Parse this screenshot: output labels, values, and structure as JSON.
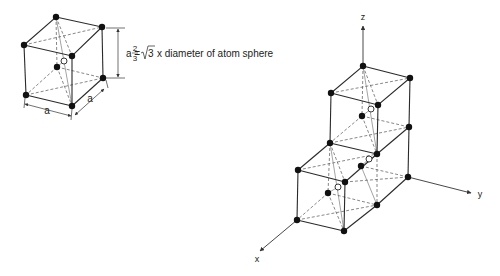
{
  "unit_cell": {
    "dimension_label": "a",
    "formula": {
      "lhs": "a =",
      "fraction_numerator": "2",
      "fraction_denominator": "3",
      "radical": "3",
      "rhs": "x diameter of atom sphere"
    },
    "width_label": "a",
    "depth_label": "a"
  },
  "lattice": {
    "axes": {
      "x": "x",
      "y": "y",
      "z": "z"
    }
  },
  "colors": {
    "line": "#2a2a2a",
    "atom": "#111111",
    "background": "#ffffff"
  }
}
